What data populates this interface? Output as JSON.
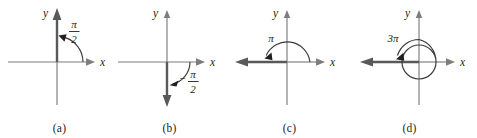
{
  "figure": {
    "background": "#ffffff",
    "axis_color": "#7d7d7d",
    "ray_color": "#58595b",
    "arc_color": "#3a3a3c",
    "text_color": "#231f20"
  },
  "panels": [
    {
      "id": "a",
      "caption": "(a)",
      "x_axis_label": "x",
      "y_axis_label": "y",
      "angle_label_numerator": "π",
      "angle_label_denominator": "2",
      "angle_label_sign": "",
      "angle_is_fraction": true,
      "angle_value_text": "π/2",
      "rotation": "counterclockwise",
      "terminal_ray_direction": "up"
    },
    {
      "id": "b",
      "caption": "(b)",
      "x_axis_label": "x",
      "y_axis_label": "y",
      "angle_label_numerator": "π",
      "angle_label_denominator": "2",
      "angle_label_sign": "−",
      "angle_is_fraction": true,
      "angle_value_text": "−π/2",
      "rotation": "clockwise",
      "terminal_ray_direction": "down"
    },
    {
      "id": "c",
      "caption": "(c)",
      "x_axis_label": "x",
      "y_axis_label": "y",
      "angle_label_numerator": "π",
      "angle_label_denominator": "",
      "angle_label_sign": "",
      "angle_is_fraction": false,
      "angle_value_text": "π",
      "rotation": "counterclockwise",
      "terminal_ray_direction": "left"
    },
    {
      "id": "d",
      "caption": "(d)",
      "x_axis_label": "x",
      "y_axis_label": "y",
      "angle_label_numerator": "3π",
      "angle_label_denominator": "",
      "angle_label_sign": "",
      "angle_is_fraction": false,
      "angle_value_text": "3π",
      "rotation": "counterclockwise",
      "terminal_ray_direction": "left"
    }
  ]
}
